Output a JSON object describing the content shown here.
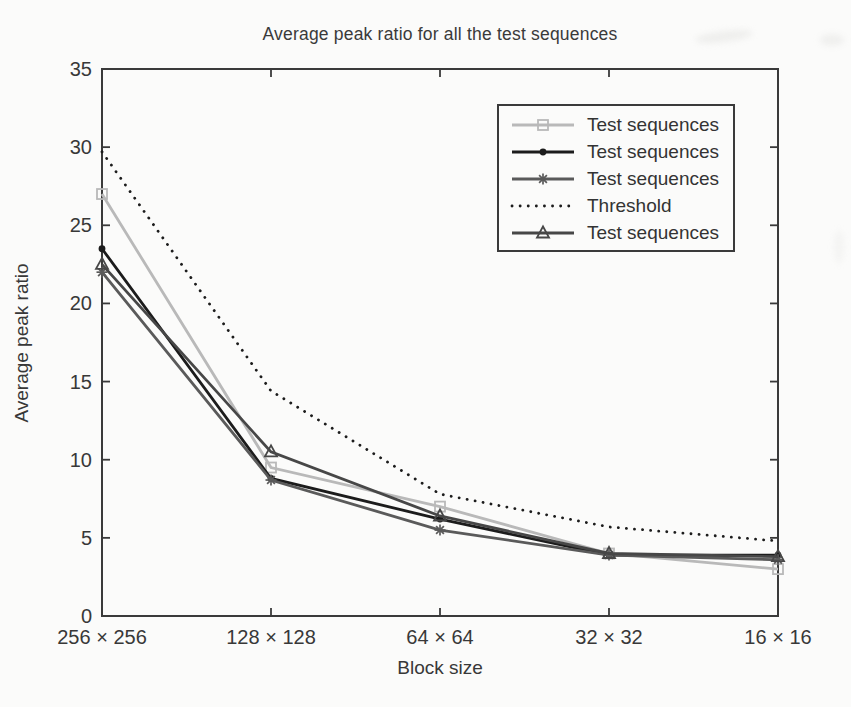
{
  "chart_data": {
    "type": "line",
    "title": "Average peak ratio for all the test sequences",
    "xlabel": "Block size",
    "ylabel": "Average peak ratio",
    "categories": [
      "256 × 256",
      "128 × 128",
      "64 × 64",
      "32 × 32",
      "16 × 16"
    ],
    "ylim": [
      0,
      35
    ],
    "yticks": [
      0,
      5,
      10,
      15,
      20,
      25,
      30,
      35
    ],
    "grid": false,
    "legend_position": "upper right",
    "axis_color": "#3a3a3a",
    "series": [
      {
        "name": "Test sequences",
        "marker": "square",
        "color": "#b9b9b9",
        "linestyle": "solid",
        "values": [
          27.0,
          9.5,
          7.0,
          4.0,
          3.0
        ]
      },
      {
        "name": "Test sequences",
        "marker": "dot",
        "color": "#1c1c1c",
        "linestyle": "solid",
        "values": [
          23.5,
          8.8,
          6.2,
          3.9,
          3.9
        ]
      },
      {
        "name": "Test sequences",
        "marker": "asterisk",
        "color": "#5a5a5a",
        "linestyle": "solid",
        "values": [
          22.0,
          8.7,
          5.5,
          3.9,
          3.6
        ]
      },
      {
        "name": "Threshold",
        "marker": "none",
        "color": "#1c1c1c",
        "linestyle": "dotted",
        "values": [
          29.7,
          14.4,
          7.8,
          5.7,
          4.8
        ]
      },
      {
        "name": "Test sequences",
        "marker": "triangle",
        "color": "#474747",
        "linestyle": "solid",
        "values": [
          22.5,
          10.5,
          6.4,
          4.0,
          3.8
        ]
      }
    ]
  }
}
